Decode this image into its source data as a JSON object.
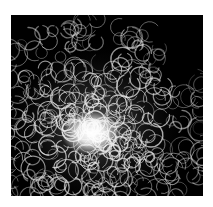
{
  "image": {
    "subject": "abstract white curling light-trail loops on black background",
    "background_color": "#000000",
    "stroke_color": "#e8e8e8",
    "glow_color": "#ffffff",
    "page_background": "#ffffff"
  }
}
